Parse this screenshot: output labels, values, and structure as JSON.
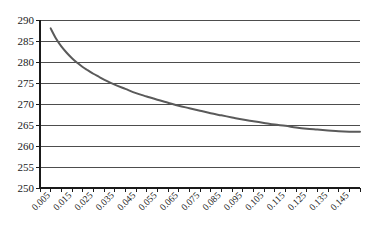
{
  "chart_data": {
    "type": "line",
    "title": "",
    "subtitle": "",
    "xlabel": "",
    "ylabel": "",
    "xlim": [
      0.0,
      0.15
    ],
    "ylim": [
      250,
      290
    ],
    "grid": true,
    "legend": false,
    "legend_position": "none",
    "y_ticks": [
      250,
      255,
      260,
      265,
      270,
      275,
      280,
      285,
      290
    ],
    "y_tick_labels": [
      "250",
      "255",
      "260",
      "265",
      "270",
      "275",
      "280",
      "285",
      "290"
    ],
    "x_ticks": [
      0.005,
      0.015,
      0.025,
      0.035,
      0.045,
      0.055,
      0.065,
      0.075,
      0.085,
      0.095,
      0.105,
      0.115,
      0.125,
      0.135,
      0.145
    ],
    "x_tick_labels": [
      "0.005",
      "0.015",
      "0.025",
      "0.035",
      "0.045",
      "0.055",
      "0.065",
      "0.075",
      "0.085",
      "0.095",
      "0.105",
      "0.115",
      "0.125",
      "0.135",
      "0.145"
    ],
    "x_minor_tick_step": 0.005,
    "series": [
      {
        "name": "curve",
        "color": "#5a5a5a",
        "line_width": 2,
        "x": [
          0.005,
          0.0075,
          0.01,
          0.0125,
          0.015,
          0.0175,
          0.02,
          0.0225,
          0.025,
          0.0275,
          0.03,
          0.035,
          0.04,
          0.045,
          0.05,
          0.055,
          0.06,
          0.065,
          0.07,
          0.075,
          0.08,
          0.085,
          0.09,
          0.095,
          0.1,
          0.105,
          0.11,
          0.115,
          0.12,
          0.125,
          0.13,
          0.135,
          0.14,
          0.145,
          0.15
        ],
        "y": [
          288.0,
          285.6,
          283.7,
          282.2,
          280.9,
          279.8,
          278.8,
          278.0,
          277.2,
          276.5,
          275.8,
          274.6,
          273.6,
          272.6,
          271.8,
          271.0,
          270.3,
          269.6,
          269.0,
          268.4,
          267.8,
          267.3,
          266.8,
          266.3,
          265.9,
          265.5,
          265.1,
          264.8,
          264.4,
          264.1,
          263.9,
          263.7,
          263.5,
          263.4,
          263.4
        ]
      }
    ],
    "annotations": []
  },
  "axes": {
    "y_axis_name": "value-axis",
    "x_axis_name": "parameter-axis"
  },
  "colors": {
    "axis": "#1a1a1a",
    "gridline": "#4d4d4d",
    "curve": "#5a5a5a",
    "background": "#ffffff",
    "text": "#1a1a1a"
  }
}
